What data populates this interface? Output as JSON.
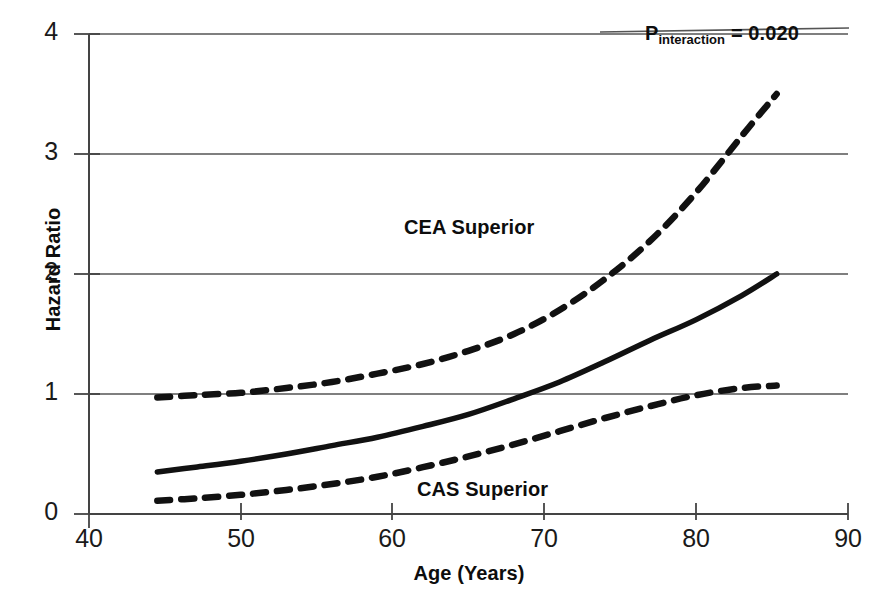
{
  "chart_data": {
    "type": "line",
    "title": "",
    "xlabel": "Age (Years)",
    "ylabel": "Hazard Ratio",
    "xlim": [
      40,
      90
    ],
    "ylim": [
      0,
      4
    ],
    "xticks": [
      40,
      50,
      60,
      70,
      80,
      90
    ],
    "yticks": [
      0,
      1,
      2,
      3,
      4
    ],
    "grid": "horizontal",
    "legend": "none",
    "x": [
      44.5,
      47,
      50,
      53,
      56,
      59,
      62,
      65,
      68,
      71,
      74,
      77,
      80,
      83,
      85.3
    ],
    "series": [
      {
        "name": "Hazard ratio (point estimate)",
        "style": "solid",
        "values": [
          0.35,
          0.39,
          0.44,
          0.5,
          0.57,
          0.64,
          0.73,
          0.83,
          0.96,
          1.1,
          1.27,
          1.45,
          1.62,
          1.82,
          2.0
        ]
      },
      {
        "name": "95% CI upper bound",
        "style": "dashed",
        "values": [
          0.97,
          0.99,
          1.01,
          1.05,
          1.1,
          1.17,
          1.25,
          1.36,
          1.5,
          1.7,
          1.96,
          2.28,
          2.68,
          3.15,
          3.5
        ]
      },
      {
        "name": "95% CI lower bound",
        "style": "dashed",
        "values": [
          0.11,
          0.13,
          0.16,
          0.2,
          0.25,
          0.31,
          0.39,
          0.48,
          0.58,
          0.69,
          0.8,
          0.9,
          0.99,
          1.05,
          1.07
        ]
      }
    ],
    "annotations": [
      {
        "name": "p-interaction",
        "text": "P",
        "subscript": "interaction",
        "equals": "= 0.020"
      },
      {
        "name": "cea-region",
        "text": "CEA Superior"
      },
      {
        "name": "cas-region",
        "text": "CAS Superior"
      }
    ]
  },
  "axes": {
    "y_title": "Hazard Ratio",
    "x_title": "Age (Years)",
    "y_tick_labels": [
      "4",
      "3",
      "2",
      "1",
      "0"
    ],
    "x_tick_labels": [
      "40",
      "50",
      "60",
      "70",
      "80",
      "90"
    ]
  },
  "annotations": {
    "p_symbol": "P",
    "p_subscript": "interaction",
    "p_value": "= 0.020",
    "cea_superior": "CEA Superior",
    "cas_superior": "CAS Superior"
  },
  "colors": {
    "line": "#111111",
    "grid": "#555555",
    "axis": "#444444",
    "text": "#111111",
    "background": "#ffffff"
  }
}
